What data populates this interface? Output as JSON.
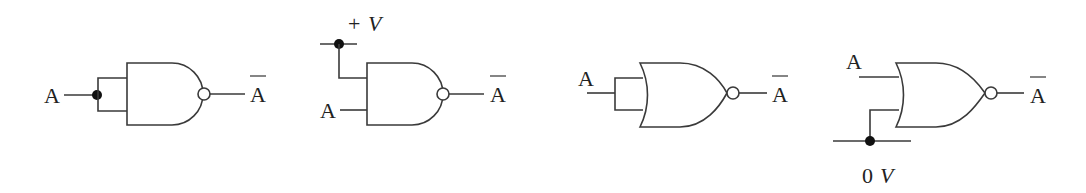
{
  "diagram": {
    "circuits": [
      {
        "id": "nand-inputs-tied",
        "gate_type": "NAND",
        "method": "inputs tied together",
        "input_label": "A",
        "output_label": "A",
        "output_overbar": true
      },
      {
        "id": "nand-input-high",
        "gate_type": "NAND",
        "method": "one input tied to +V",
        "input_label": "A",
        "supply_label_sign": "+",
        "supply_label_var": "V",
        "output_label": "A",
        "output_overbar": true
      },
      {
        "id": "nor-inputs-tied",
        "gate_type": "NOR",
        "method": "inputs tied together",
        "input_label": "A",
        "output_label": "A",
        "output_overbar": true
      },
      {
        "id": "nor-input-low",
        "gate_type": "NOR",
        "method": "one input tied to 0 V",
        "input_label": "A",
        "ground_label_num": "0",
        "ground_label_var": "V",
        "output_label": "A",
        "output_overbar": true
      }
    ],
    "colors": {
      "line": "#3a3a3a",
      "node": "#111111",
      "background": "#ffffff"
    }
  }
}
